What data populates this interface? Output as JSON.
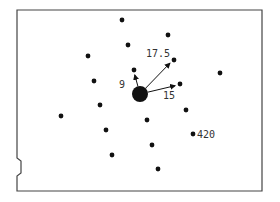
{
  "diagram": {
    "frame": {
      "left": 17,
      "top": 10,
      "right": 262,
      "bottom": 191,
      "notch_top": 158,
      "notch_bottom": 176
    },
    "center": {
      "x": 140,
      "y": 94,
      "r": 8
    },
    "dots": [
      {
        "x": 122,
        "y": 20
      },
      {
        "x": 168,
        "y": 35
      },
      {
        "x": 128,
        "y": 45
      },
      {
        "x": 88,
        "y": 56
      },
      {
        "x": 174,
        "y": 60
      },
      {
        "x": 134,
        "y": 70
      },
      {
        "x": 220,
        "y": 73
      },
      {
        "x": 94,
        "y": 81
      },
      {
        "x": 180,
        "y": 84
      },
      {
        "x": 100,
        "y": 105
      },
      {
        "x": 186,
        "y": 110
      },
      {
        "x": 61,
        "y": 116
      },
      {
        "x": 147,
        "y": 120
      },
      {
        "x": 193,
        "y": 134
      },
      {
        "x": 106,
        "y": 130
      },
      {
        "x": 152,
        "y": 145
      },
      {
        "x": 112,
        "y": 155
      },
      {
        "x": 158,
        "y": 169
      }
    ],
    "arrows": [
      {
        "to_x": 134,
        "to_y": 72,
        "label": "9",
        "label_x": 119,
        "label_y": 88
      },
      {
        "to_x": 172,
        "to_y": 61,
        "label": "17.5",
        "label_x": 146,
        "label_y": 57
      },
      {
        "to_x": 178,
        "to_y": 85,
        "label": "15",
        "label_x": 163,
        "label_y": 99
      }
    ],
    "annotations": [
      {
        "text": "420",
        "x": 197,
        "y": 138
      }
    ],
    "colors": {
      "ink": "#111111",
      "frame": "#444444",
      "background": "#ffffff"
    }
  }
}
